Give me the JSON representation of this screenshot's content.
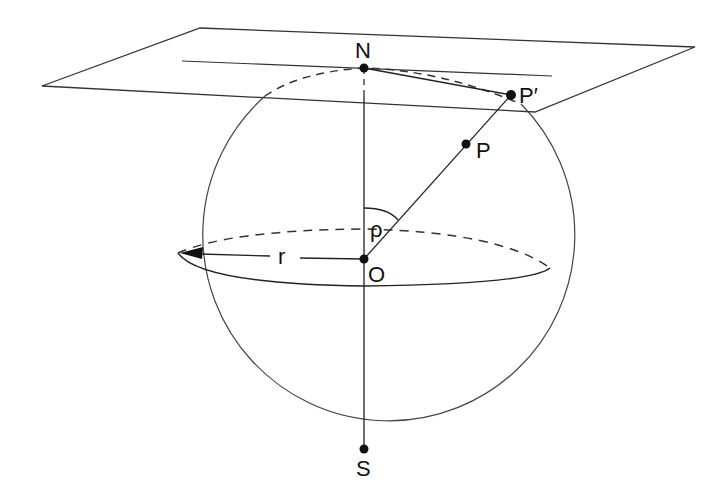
{
  "diagram": {
    "labels": {
      "north": "N",
      "south": "S",
      "center": "O",
      "point": "P",
      "projected_point": "P′",
      "radius": "r",
      "angle": "ρ"
    },
    "colors": {
      "stroke": "#222222",
      "background": "#ffffff"
    }
  }
}
